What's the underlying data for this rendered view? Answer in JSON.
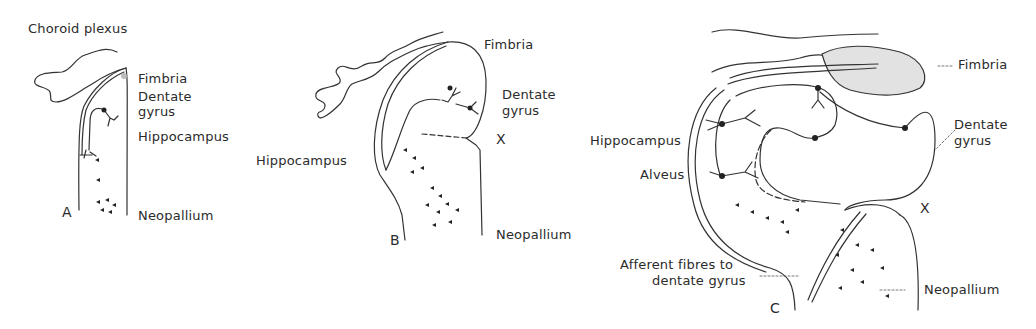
{
  "figure": {
    "panels": [
      {
        "id": "A",
        "letter": "A",
        "labels": {
          "choroid_plexus": "Choroid plexus",
          "fimbria": "Fimbria",
          "dentate_gyrus_1": "Dentate",
          "dentate_gyrus_2": "gyrus",
          "hippocampus": "Hippocampus",
          "neopallium": "Neopallium"
        }
      },
      {
        "id": "B",
        "letter": "B",
        "labels": {
          "fimbria": "Fimbria",
          "dentate_gyrus_1": "Dentate",
          "dentate_gyrus_2": "gyrus",
          "x_marker": "X",
          "hippocampus": "Hippocampus",
          "neopallium": "Neopallium"
        }
      },
      {
        "id": "C",
        "letter": "C",
        "labels": {
          "fimbria": "Fimbria",
          "dentate_gyrus_1": "Dentate",
          "dentate_gyrus_2": "gyrus",
          "hippocampus": "Hippocampus",
          "alveus": "Alveus",
          "x_marker": "X",
          "afferent_1": "Afferent fibres to",
          "afferent_2": "dentate gyrus",
          "neopallium": "Neopallium"
        }
      }
    ]
  }
}
